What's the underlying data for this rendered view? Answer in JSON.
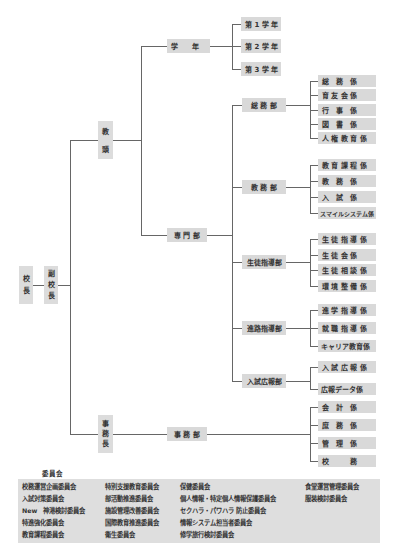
{
  "chart": {
    "root": {
      "principal": "校\n長",
      "vice_principal": "副\n校\n長"
    },
    "teaching_head": "教\n頭",
    "admin_head": "事\n務\n長",
    "grade": {
      "label": "学　　年",
      "items": [
        "第 1 学 年",
        "第 2 学 年",
        "第 3 学 年"
      ]
    },
    "specialized": {
      "label": "専 門 部"
    },
    "departments": [
      {
        "label": "総 務 部",
        "sections": [
          "総　務　係",
          "育 友 会 係",
          "行　事　係",
          "図　書　係",
          "人 権 教 育 係"
        ]
      },
      {
        "label": "教 務 部",
        "sections": [
          "教 育 課 程 係",
          "教　務　係",
          "入　試　係",
          "スマイルシステム係"
        ]
      },
      {
        "label": "生徒指導部",
        "sections": [
          "生 徒 指 導 係",
          "生 徒 会 係",
          "生 徒 相 談 係",
          "環 境 整 備 係"
        ]
      },
      {
        "label": "進路指導部",
        "sections": [
          "進 学 指 導 係",
          "就 職 指 導 係",
          "キャリア教育係"
        ]
      },
      {
        "label": "入試広報部",
        "sections": [
          "入 試 広 報 係",
          "広報データ係"
        ]
      }
    ],
    "office": {
      "label": "事 務 部",
      "sections": [
        "会　計　係",
        "庶　務　係",
        "管　理　係",
        "校　　　務"
      ]
    }
  },
  "committees": {
    "title": "委員会",
    "columns": [
      [
        "校務運営企画委員会",
        "入試対策委員会",
        "New　神港検討委員会",
        "特進強化委員会",
        "教育課程委員会"
      ],
      [
        "特別支援教育委員会",
        "部活動推進委員会",
        "施設管理改善委員会",
        "国際教育推進委員会",
        "衛生委員会"
      ],
      [
        "保健委員会",
        "個人情報・特定個人情報保護委員会",
        "セクハラ・パワハラ 防止委員会",
        "情報システム担当者委員会",
        "修学旅行検討委員会"
      ],
      [
        "食堂運営管理委員会",
        "服装検討委員会"
      ]
    ]
  }
}
